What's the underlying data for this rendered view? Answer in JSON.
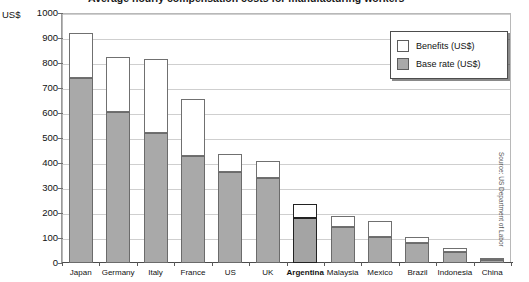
{
  "chart_data": {
    "type": "bar",
    "stacked": true,
    "title": "Average hourly compensation costs for manufacturing workers",
    "title_visibility": "cropped at top edge of screenshot",
    "units_label": "US$",
    "xlabel": "",
    "ylabel": "US$",
    "ylim": [
      0,
      1000
    ],
    "ytick_step": 100,
    "yticks": [
      0,
      100,
      200,
      300,
      400,
      500,
      600,
      700,
      800,
      900,
      1000
    ],
    "grid": true,
    "grid_orientation": "horizontal",
    "legend_position": "top-right inside plot",
    "categories": [
      "Japan",
      "Germany",
      "Italy",
      "France",
      "US",
      "UK",
      "Argentina",
      "Malaysia",
      "Mexico",
      "Brazil",
      "Indonesia",
      "China"
    ],
    "highlight_category": "Argentina",
    "series": [
      {
        "name": "Base rate (US$)",
        "color": "#a9a9a9",
        "values": [
          740,
          605,
          520,
          430,
          365,
          340,
          180,
          145,
          105,
          80,
          45,
          12
        ]
      },
      {
        "name": "Benefits (US$)",
        "color": "#ffffff",
        "values": [
          180,
          220,
          295,
          225,
          70,
          70,
          56,
          45,
          65,
          25,
          15,
          3
        ]
      }
    ],
    "totals": [
      920,
      825,
      815,
      655,
      435,
      410,
      236,
      190,
      170,
      105,
      60,
      15
    ],
    "annotations": [
      {
        "name": "source",
        "text": "Source: US Department of Labor",
        "orientation": "vertical",
        "position": "right edge"
      }
    ]
  },
  "legend": {
    "items": [
      {
        "label": "Benefits (US$)",
        "swatch": "benefits"
      },
      {
        "label": "Base rate (US$)",
        "swatch": "base"
      }
    ]
  },
  "colors": {
    "base_rate": "#a9a9a9",
    "benefits": "#ffffff",
    "bar_outline": "#707070",
    "highlight_outline": "#222222",
    "gridline": "#cfcfcf",
    "axis": "#4a4a4a",
    "text": "#111111"
  }
}
